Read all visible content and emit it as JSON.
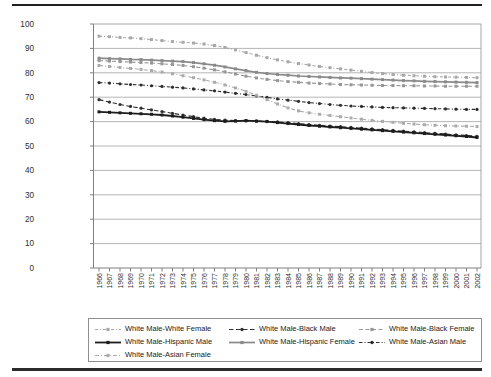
{
  "chart_data": {
    "type": "line",
    "title": "",
    "xlabel": "",
    "ylabel": "",
    "ylim": [
      0,
      100
    ],
    "ytick_step": 10,
    "y_ticks": [
      0,
      10,
      20,
      30,
      40,
      50,
      60,
      70,
      80,
      90,
      100
    ],
    "grid": "horizontal",
    "legend_position": "bottom-box",
    "x": [
      1966,
      1967,
      1968,
      1969,
      1970,
      1971,
      1972,
      1973,
      1974,
      1975,
      1976,
      1977,
      1978,
      1979,
      1980,
      1981,
      1982,
      1983,
      1984,
      1985,
      1986,
      1987,
      1988,
      1989,
      1990,
      1991,
      1992,
      1993,
      1994,
      1995,
      1996,
      1997,
      1998,
      1999,
      2000,
      2001,
      2002
    ],
    "series": [
      {
        "name": "White Male-White Female",
        "color": "#a8a8a8",
        "dash": "3 2 1 2",
        "marker": "square",
        "width": 1.1,
        "values": [
          95.0,
          94.8,
          94.5,
          94.3,
          94.0,
          93.6,
          93.2,
          92.8,
          92.5,
          92.2,
          91.8,
          91.2,
          90.4,
          89.4,
          88.3,
          87.2,
          86.2,
          85.3,
          84.5,
          83.8,
          83.2,
          82.6,
          82.1,
          81.6,
          81.1,
          80.6,
          80.1,
          79.7,
          79.3,
          79.0,
          78.8,
          78.6,
          78.4,
          78.3,
          78.2,
          78.1,
          78.0
        ]
      },
      {
        "name": "White Male-Black Male",
        "color": "#303030",
        "dash": "4.5 2.5",
        "marker": "circle",
        "width": 1.1,
        "values": [
          69.0,
          68.0,
          67.0,
          66.2,
          65.5,
          64.8,
          64.1,
          63.4,
          62.7,
          62.0,
          61.4,
          60.9,
          60.6,
          60.4,
          60.3,
          60.2,
          60.1,
          59.9,
          59.6,
          59.2,
          58.8,
          58.5,
          58.2,
          57.9,
          57.6,
          57.3,
          57.0,
          56.7,
          56.4,
          56.1,
          55.8,
          55.5,
          55.2,
          54.9,
          54.6,
          54.3,
          54.0
        ]
      },
      {
        "name": "White Male-Black Female",
        "color": "#979797",
        "dash": "4 2.5",
        "marker": "square",
        "width": 1.1,
        "values": [
          85.0,
          84.8,
          84.6,
          84.4,
          84.2,
          84.0,
          83.7,
          83.4,
          83.0,
          82.5,
          81.9,
          81.2,
          80.4,
          79.5,
          78.6,
          77.9,
          77.3,
          76.8,
          76.4,
          76.1,
          75.8,
          75.6,
          75.4,
          75.2,
          75.1,
          75.0,
          74.9,
          74.8,
          74.8,
          74.7,
          74.7,
          74.6,
          74.6,
          74.5,
          74.5,
          74.5,
          74.5
        ]
      },
      {
        "name": "White Male-Hispanic Male",
        "color": "#1c1c1c",
        "dash": "",
        "marker": "square",
        "width": 1.8,
        "values": [
          64.0,
          63.8,
          63.6,
          63.4,
          63.2,
          63.0,
          62.7,
          62.3,
          61.8,
          61.3,
          60.8,
          60.4,
          60.1,
          60.2,
          60.4,
          60.2,
          60.0,
          59.6,
          59.2,
          58.8,
          58.4,
          58.1,
          57.8,
          57.5,
          57.2,
          56.9,
          56.6,
          56.3,
          56.0,
          55.7,
          55.4,
          55.1,
          54.8,
          54.5,
          54.2,
          53.9,
          53.5
        ]
      },
      {
        "name": "White Male-Hispanic Female",
        "color": "#8a8a8a",
        "dash": "",
        "marker": "square",
        "width": 1.7,
        "values": [
          86.0,
          85.8,
          85.7,
          85.5,
          85.4,
          85.2,
          85.0,
          84.8,
          84.6,
          84.2,
          83.7,
          83.1,
          82.4,
          81.6,
          80.9,
          80.2,
          79.7,
          79.3,
          79.0,
          78.7,
          78.5,
          78.3,
          78.1,
          77.9,
          77.8,
          77.6,
          77.4,
          77.2,
          77.0,
          76.8,
          76.7,
          76.5,
          76.4,
          76.3,
          76.2,
          76.1,
          76.0
        ]
      },
      {
        "name": "White Male-Asian Male",
        "color": "#2e2e2e",
        "dash": "3.5 2 1 2",
        "marker": "circle",
        "width": 1.1,
        "values": [
          76.0,
          75.8,
          75.5,
          75.2,
          75.0,
          74.7,
          74.4,
          74.1,
          73.8,
          73.4,
          73.0,
          72.6,
          72.1,
          71.6,
          71.1,
          70.5,
          69.9,
          69.3,
          68.8,
          68.3,
          67.8,
          67.4,
          67.0,
          66.7,
          66.4,
          66.2,
          66.0,
          65.8,
          65.7,
          65.6,
          65.5,
          65.4,
          65.3,
          65.2,
          65.1,
          65.0,
          65.0
        ]
      },
      {
        "name": "White Male-Asian Female",
        "color": "#ababab",
        "dash": "4 2 1 2",
        "marker": "square",
        "width": 1.1,
        "values": [
          83.0,
          82.6,
          82.2,
          81.8,
          81.4,
          80.9,
          80.3,
          79.6,
          78.8,
          78.0,
          77.1,
          76.1,
          75.0,
          73.8,
          72.4,
          70.8,
          69.0,
          67.2,
          65.6,
          64.4,
          63.6,
          63.0,
          62.5,
          62.0,
          61.5,
          61.0,
          60.5,
          60.1,
          59.7,
          59.3,
          59.0,
          58.7,
          58.5,
          58.3,
          58.2,
          58.1,
          58.0
        ]
      }
    ],
    "axis_color": "#808080",
    "gridline_color": "#b6b6b6",
    "border_color": "#a6a6a6"
  }
}
